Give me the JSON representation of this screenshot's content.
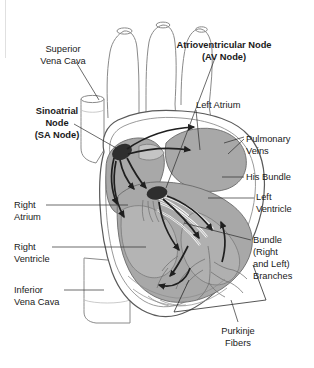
{
  "figure": {
    "style": "grayscale anatomical line illustration",
    "colors": {
      "background": "#ffffff",
      "text": "#1a1a1a",
      "leader_line": "#2b2b2b",
      "chamber_fill": "#a8a8a8",
      "chamber_fill_light": "#c4c4c4",
      "muscle_outline": "#5a5a5a",
      "vessel_outline": "#8a8a8a",
      "node_fill": "#2e2e2e",
      "arrow": "#1f1f1f",
      "pathway_white": "#f4f4f4"
    }
  },
  "labels": [
    {
      "id": "superior-vena-cava",
      "lines": [
        "Superior",
        "Vena Cava"
      ],
      "bold": false,
      "align": "middle",
      "x": 63,
      "y": 52,
      "line_height": 12
    },
    {
      "id": "atrioventricular-node",
      "lines": [
        "Atrioventricular Node",
        "(AV Node)"
      ],
      "bold": true,
      "align": "middle",
      "x": 224,
      "y": 48,
      "line_height": 12
    },
    {
      "id": "sinoatrial-node",
      "lines": [
        "Sinoatrial",
        "Node",
        "(SA Node)"
      ],
      "bold": true,
      "align": "middle",
      "x": 57,
      "y": 114,
      "line_height": 12
    },
    {
      "id": "left-atrium",
      "lines": [
        "Left Atrium"
      ],
      "bold": false,
      "align": "start",
      "x": 196,
      "y": 108,
      "line_height": 12
    },
    {
      "id": "pulmonary-veins",
      "lines": [
        "Pulmonary",
        "Veins"
      ],
      "bold": false,
      "align": "start",
      "x": 246,
      "y": 142,
      "line_height": 12
    },
    {
      "id": "his-bundle",
      "lines": [
        "His Bundle"
      ],
      "bold": false,
      "align": "start",
      "x": 246,
      "y": 180,
      "line_height": 12
    },
    {
      "id": "left-ventricle",
      "lines": [
        "Left",
        "Ventricle"
      ],
      "bold": false,
      "align": "start",
      "x": 256,
      "y": 200,
      "line_height": 12
    },
    {
      "id": "right-atrium",
      "lines": [
        "Right",
        "Atrium"
      ],
      "bold": false,
      "align": "start",
      "x": 14,
      "y": 208,
      "line_height": 12
    },
    {
      "id": "right-ventricle",
      "lines": [
        "Right",
        "Ventricle"
      ],
      "bold": false,
      "align": "start",
      "x": 14,
      "y": 250,
      "line_height": 12
    },
    {
      "id": "bundle-branches",
      "lines": [
        "Bundle",
        "(Right",
        "and Left)",
        "Branches"
      ],
      "bold": false,
      "align": "start",
      "x": 253,
      "y": 243,
      "line_height": 12
    },
    {
      "id": "inferior-vena-cava",
      "lines": [
        "Inferior",
        "Vena Cava"
      ],
      "bold": false,
      "align": "start",
      "x": 14,
      "y": 293,
      "line_height": 12
    },
    {
      "id": "purkinje-fibers",
      "lines": [
        "Purkinje",
        "Fibers"
      ],
      "bold": false,
      "align": "middle",
      "x": 238,
      "y": 334,
      "line_height": 12
    }
  ],
  "anatomy_parts": [
    "aortic arch",
    "brachiocephalic trunk",
    "left common carotid artery",
    "left subclavian artery",
    "superior vena cava",
    "inferior vena cava",
    "pulmonary veins",
    "right atrium",
    "left atrium",
    "right ventricle",
    "left ventricle",
    "interventricular septum",
    "sinoatrial node",
    "atrioventricular node",
    "bundle of His",
    "right bundle branch",
    "left bundle branch",
    "purkinje fibers",
    "cardiac apex"
  ]
}
